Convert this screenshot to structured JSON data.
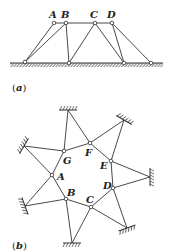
{
  "figures": [
    {
      "id": "a",
      "caption": {
        "open": "(",
        "letter": "a",
        "close": ")"
      },
      "nodes": {
        "A": "A",
        "B": "B",
        "C": "C",
        "D": "D"
      }
    },
    {
      "id": "b",
      "caption": {
        "open": "(",
        "letter": "b",
        "close": ")"
      },
      "nodes": {
        "A": "A",
        "B": "B",
        "C": "C",
        "D": "D",
        "E": "E",
        "F": "F",
        "G": "G"
      }
    }
  ]
}
